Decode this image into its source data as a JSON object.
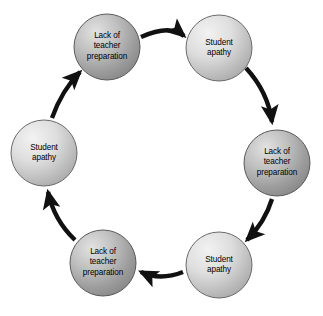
{
  "diagram": {
    "type": "cycle",
    "direction": "clockwise",
    "background_color": "#ffffff",
    "node_count": 6,
    "arrow_count": 6,
    "node_fill_light": "#e8e8e8",
    "node_fill_mid": "#c9c9c9",
    "node_fill_dark": "#8e8e8e",
    "node_stroke_color": "#4a4a4a",
    "arrow_color": "#111111",
    "label_color": "#000000",
    "nodes": [
      {
        "id": "node-1",
        "label": "Lack of\nteacher\npreparation",
        "position": "top-left",
        "cx": 107,
        "cy": 47,
        "r": 33,
        "shade": "dark"
      },
      {
        "id": "node-2",
        "label": "Student\napathy",
        "position": "top-right",
        "cx": 219,
        "cy": 48,
        "r": 33,
        "shade": "light"
      },
      {
        "id": "node-3",
        "label": "Lack of\nteacher\npreparation",
        "position": "right",
        "cx": 277,
        "cy": 163,
        "r": 33,
        "shade": "dark"
      },
      {
        "id": "node-4",
        "label": "Student\napathy",
        "position": "bottom-right",
        "cx": 219,
        "cy": 265,
        "r": 33,
        "shade": "light"
      },
      {
        "id": "node-5",
        "label": "Lack of\nteacher\npreparation",
        "position": "bottom-left",
        "cx": 103,
        "cy": 263,
        "r": 33,
        "shade": "dark"
      },
      {
        "id": "node-6",
        "label": "Student\napathy",
        "position": "left",
        "cx": 44,
        "cy": 153,
        "r": 33,
        "shade": "light"
      }
    ],
    "arrows": [
      {
        "id": "arrow-1",
        "from": "node-1",
        "to": "node-2",
        "path": "M 141 37 Q 170 24 184 36"
      },
      {
        "id": "arrow-2",
        "from": "node-2",
        "to": "node-3",
        "path": "M 246 68 Q 268 92 272 122"
      },
      {
        "id": "arrow-3",
        "from": "node-3",
        "to": "node-4",
        "path": "M 272 199 Q 265 222 247 240"
      },
      {
        "id": "arrow-4",
        "from": "node-4",
        "to": "node-5",
        "path": "M 183 272 Q 160 281 141 272"
      },
      {
        "id": "arrow-5",
        "from": "node-5",
        "to": "node-6",
        "path": "M 75 240 Q 54 220 48 192"
      },
      {
        "id": "arrow-6",
        "from": "node-6",
        "to": "node-1",
        "path": "M 52 118 Q 62 90 80 72"
      }
    ]
  }
}
